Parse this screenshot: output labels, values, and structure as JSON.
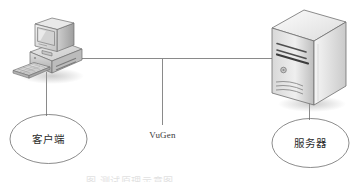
{
  "figure": {
    "type": "network-topology-diagram",
    "background_color": "#ffffff",
    "line_color": "#8a8a8a",
    "outline_color": "#6e6e6e",
    "label_color": "#2b2b2b"
  },
  "nodes": {
    "client": {
      "label": "客户端",
      "icon": "desktop-computer-icon",
      "parts": [
        "crt-monitor",
        "horizontal-case",
        "keyboard"
      ]
    },
    "server": {
      "label": "服务器",
      "icon": "server-tower-icon",
      "parts": [
        "drive-bay-slots",
        "power-button",
        "vent-grille"
      ]
    }
  },
  "connection": {
    "label": "VuGen",
    "style": "solid"
  },
  "caption": {
    "text": "图      测试原理示意图",
    "visible": "clipped"
  }
}
